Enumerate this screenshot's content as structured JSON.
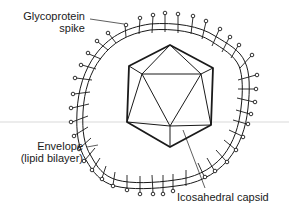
{
  "diagram": {
    "labels": {
      "glycoprotein": {
        "line1": "Glycoprotein",
        "line2": "spike"
      },
      "envelope": {
        "line1": "Envelope",
        "line2": "(lipid bilayer)"
      },
      "capsid": {
        "line1": "Icosahedral capsid"
      }
    },
    "colors": {
      "stroke": "#1a1a1a",
      "rule": "#c8c8c8",
      "background": "#ffffff"
    }
  }
}
